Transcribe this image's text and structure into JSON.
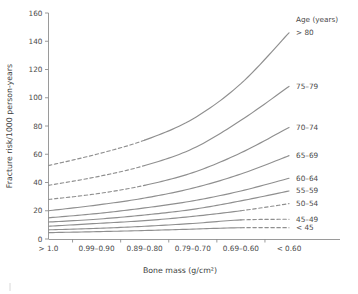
{
  "chart_data": {
    "type": "line",
    "title": "",
    "xlabel": "Bone mass (g/cm²)",
    "ylabel": "Fracture risk/1000 person-years",
    "categories": [
      "> 1.0",
      "0.99–0.90",
      "0.89–0.80",
      "0.79–0.70",
      "0.69–0.60",
      "< 0.60"
    ],
    "ylim": [
      0,
      160
    ],
    "yticks": [
      0,
      20,
      40,
      60,
      80,
      100,
      120,
      140,
      160
    ],
    "grid": false,
    "legend_position": "right-inline",
    "legend_title": "Age (years)",
    "line_color": "#8f8f8f",
    "series": [
      {
        "name": "> 80",
        "values": [
          52,
          60,
          70,
          85,
          110,
          146
        ],
        "dashed_segment": "left",
        "dash_until_index": 2,
        "label": "> 80"
      },
      {
        "name": "75–79",
        "values": [
          38,
          44,
          52,
          64,
          84,
          108
        ],
        "dashed_segment": "left",
        "dash_until_index": 2,
        "label": "75–79"
      },
      {
        "name": "70–74",
        "values": [
          28,
          32,
          38,
          47,
          61,
          79
        ],
        "dashed_segment": "left",
        "dash_until_index": 2,
        "label": "70–74"
      },
      {
        "name": "65–69",
        "values": [
          20,
          24,
          29,
          36,
          46,
          59
        ],
        "dashed_segment": "none",
        "dash_until_index": 0,
        "label": "65–69"
      },
      {
        "name": "60–64",
        "values": [
          15,
          18,
          22,
          27,
          34,
          43
        ],
        "dashed_segment": "none",
        "dash_until_index": 0,
        "label": "60–64"
      },
      {
        "name": "55–59",
        "values": [
          12,
          14,
          17,
          21,
          27,
          34
        ],
        "dashed_segment": "none",
        "dash_until_index": 0,
        "label": "55–59"
      },
      {
        "name": "50–54",
        "values": [
          9,
          11,
          13,
          16,
          20,
          25
        ],
        "dashed_segment": "right",
        "dash_from_index": 4,
        "label": "50–54"
      },
      {
        "name": "45–49",
        "values": [
          6.5,
          7.5,
          9,
          11,
          13.5,
          14
        ],
        "dashed_segment": "right",
        "dash_from_index": 4,
        "label": "45–49"
      },
      {
        "name": "< 45",
        "values": [
          4.5,
          5.2,
          6,
          7,
          8,
          8
        ],
        "dashed_segment": "right",
        "dash_from_index": 4,
        "label": "< 45"
      }
    ],
    "legend_entries": [
      {
        "label": "Age (years)",
        "y_value": 160
      },
      {
        "label": "> 80",
        "y_value": 146
      },
      {
        "label": "75–79",
        "y_value": 108
      },
      {
        "label": "70–74",
        "y_value": 79
      },
      {
        "label": "65–69",
        "y_value": 59
      },
      {
        "label": "60–64",
        "y_value": 43
      },
      {
        "label": "55–59",
        "y_value": 34
      },
      {
        "label": "50–54",
        "y_value": 25
      },
      {
        "label": "45–49",
        "y_value": 14
      },
      {
        "label": "< 45",
        "y_value": 8
      }
    ]
  }
}
